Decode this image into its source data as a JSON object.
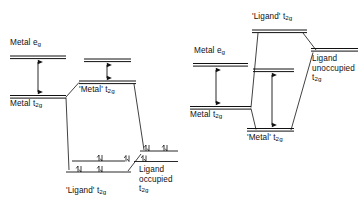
{
  "figure": {
    "type": "molecular-orbital-energy-level-diagram",
    "panels": [
      {
        "id": "left",
        "description": "Metal t2g below ligand occupied t2g - bonding interaction raising metal t2g",
        "labels": {
          "metal_eg": "Metal e",
          "metal_eg_sub": "g",
          "metal_t2g": "Metal t",
          "metal_t2g_sub": "2g",
          "mo_metal_t2g": "'Metal' t",
          "mo_metal_t2g_sub": "2g",
          "mo_ligand_t2g": "'Ligand' t",
          "mo_ligand_t2g_sub": "2g",
          "ligand_occupied_line1": "Ligand",
          "ligand_occupied_line2": "occupied",
          "ligand_occupied_line3": "t",
          "ligand_occupied_line3_sub": "2g"
        },
        "levels": [
          {
            "name": "metal-eg-level",
            "x1": 10,
            "x2": 66,
            "y": 57,
            "double": true
          },
          {
            "name": "metal-t2g-level",
            "x1": 10,
            "x2": 66,
            "y": 97,
            "double": true
          },
          {
            "name": "mo-upper-eg-level",
            "x1": 84,
            "x2": 131,
            "y": 60,
            "double": true
          },
          {
            "name": "mo-metal-t2g-level",
            "x1": 79,
            "x2": 136,
            "y": 82,
            "double": true
          },
          {
            "name": "mo-ligand-t2g-upper",
            "x1": 72,
            "x2": 125,
            "y": 161,
            "double": false
          },
          {
            "name": "mo-ligand-t2g-lower",
            "x1": 66,
            "x2": 131,
            "y": 172,
            "double": false
          },
          {
            "name": "ligand-occupied-upper",
            "x1": 140,
            "x2": 178,
            "y": 152,
            "double": false
          },
          {
            "name": "ligand-occupied-lower",
            "x1": 135,
            "x2": 178,
            "y": 162,
            "double": false
          }
        ],
        "gap_arrow": {
          "name": "metal-splitting-arrow",
          "x": 38,
          "y1": 59,
          "y2": 95
        },
        "mo_gap_arrow": {
          "name": "mo-splitting-arrow",
          "x": 107,
          "y1": 63,
          "y2": 80
        },
        "electrons": [
          {
            "name": "electron-pair",
            "x": 101,
            "y": 158
          },
          {
            "name": "electron-pair",
            "x": 80,
            "y": 169
          },
          {
            "name": "electron-pair",
            "x": 101,
            "y": 169
          },
          {
            "name": "electron-pair",
            "x": 167,
            "y": 148
          },
          {
            "name": "electron-pair",
            "x": 148,
            "y": 149
          },
          {
            "name": "electron-pair",
            "x": 128,
            "y": 157
          },
          {
            "name": "electron-pair",
            "x": 145,
            "y": 159
          }
        ],
        "correlation_lines": [
          {
            "name": "metal-to-mo-upper",
            "x1": 66,
            "y1": 97,
            "x2": 79,
            "y2": 82
          },
          {
            "name": "metal-to-mo-lower",
            "x1": 66,
            "y1": 97,
            "x2": 76,
            "y2": 168
          },
          {
            "name": "mo-lower-to-ligand",
            "x1": 128,
            "y1": 169,
            "x2": 140,
            "y2": 155
          },
          {
            "name": "mo-upper-to-ligand",
            "x1": 134,
            "y1": 84,
            "x2": 143,
            "y2": 151
          }
        ]
      },
      {
        "id": "right",
        "description": "Ligand unoccupied t2g above metal t2g - backbonding lowering metal t2g",
        "labels": {
          "metal_eg": "Metal e",
          "metal_eg_sub": "g",
          "metal_t2g": "Metal t",
          "metal_t2g_sub": "2g",
          "mo_ligand_t2g": "'Ligand' t",
          "mo_ligand_t2g_sub": "2g",
          "mo_metal_t2g": "'Metal' t",
          "mo_metal_t2g_sub": "2g",
          "ligand_unoccupied_line1": "Ligand",
          "ligand_unoccupied_line2": "unoccupied",
          "ligand_unoccupied_line3": "t",
          "ligand_unoccupied_line3_sub": "2g"
        },
        "levels": [
          {
            "name": "metal-eg-level",
            "x1": 193,
            "x2": 248,
            "y": 65,
            "double": true
          },
          {
            "name": "metal-t2g-level",
            "x1": 190,
            "x2": 251,
            "y": 108,
            "double": true
          },
          {
            "name": "mo-ligand-t2g-level",
            "x1": 252,
            "x2": 307,
            "y": 31,
            "double": true
          },
          {
            "name": "mo-upper-eg-level",
            "x1": 253,
            "x2": 294,
            "y": 70,
            "double": true
          },
          {
            "name": "mo-metal-t2g-level",
            "x1": 247,
            "x2": 294,
            "y": 130,
            "double": true
          },
          {
            "name": "ligand-unoccupied-level",
            "x1": 311,
            "x2": 358,
            "y": 50,
            "double": true
          }
        ],
        "gap_arrow": {
          "name": "metal-splitting-arrow",
          "x": 216,
          "y1": 68,
          "y2": 105
        },
        "mo_gap_arrow": {
          "name": "mo-splitting-arrow",
          "x": 272,
          "y1": 73,
          "y2": 128
        },
        "electrons": [],
        "correlation_lines": [
          {
            "name": "metal-to-mo-ligand",
            "x1": 251,
            "y1": 108,
            "x2": 258,
            "y2": 33
          },
          {
            "name": "metal-to-mo-metal",
            "x1": 251,
            "y1": 108,
            "x2": 258,
            "y2": 130
          },
          {
            "name": "mo-ligand-to-ligand",
            "x1": 303,
            "y1": 33,
            "x2": 315,
            "y2": 50
          },
          {
            "name": "mo-metal-to-ligand",
            "x1": 291,
            "y1": 130,
            "x2": 313,
            "y2": 53
          }
        ]
      }
    ]
  }
}
